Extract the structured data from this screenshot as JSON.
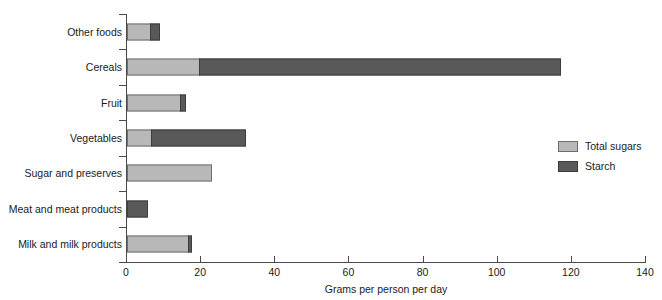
{
  "chart_data": {
    "type": "bar",
    "orientation": "horizontal",
    "stacked": true,
    "title": "",
    "subtitle": "",
    "xlabel": "Grams per person per day",
    "ylabel": "",
    "xlim": [
      0,
      140
    ],
    "xticks": [
      0,
      20,
      40,
      60,
      80,
      100,
      120,
      140
    ],
    "xtick_labels": [
      "0",
      "20",
      "40",
      "60",
      "80",
      "100",
      "120",
      "140"
    ],
    "grid": false,
    "legend_position": "right",
    "categories": [
      "Other foods",
      "Cereals",
      "Fruit",
      "Vegetables",
      "Sugar and preserves",
      "Meat and meat products",
      "Milk and milk products"
    ],
    "series": [
      {
        "name": "Total sugars",
        "color": "#b8b8b8",
        "values": [
          6.5,
          19.7,
          14.6,
          6.7,
          23.0,
          0.0,
          16.7
        ]
      },
      {
        "name": "Starch",
        "color": "#595959",
        "values": [
          2.7,
          97.6,
          1.6,
          25.7,
          0.0,
          5.7,
          1.1
        ]
      }
    ],
    "totals": [
      9.2,
      117.3,
      16.2,
      32.4,
      23.0,
      5.7,
      17.8
    ]
  },
  "axis": {
    "x_title": "Grams per person per day"
  },
  "legend": {
    "items": [
      {
        "label": "Total sugars",
        "color": "#b8b8b8"
      },
      {
        "label": "Starch",
        "color": "#595959"
      }
    ]
  }
}
